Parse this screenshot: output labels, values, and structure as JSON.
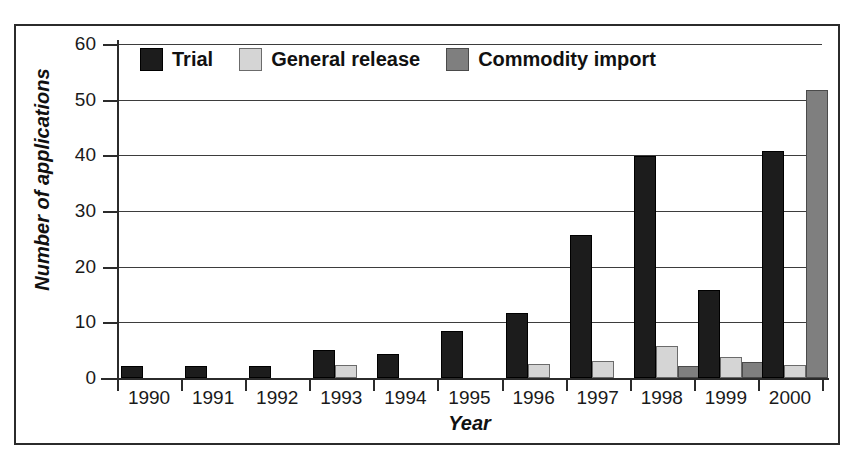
{
  "chart_data": {
    "type": "bar",
    "title": "",
    "xlabel": "Year",
    "ylabel": "Number of applications",
    "categories": [
      "1990",
      "1991",
      "1992",
      "1993",
      "1994",
      "1995",
      "1996",
      "1997",
      "1998",
      "1999",
      "2000"
    ],
    "series": [
      {
        "name": "Trial",
        "color": "#1c1c1c",
        "values": [
          2.1,
          2.1,
          2.1,
          5.0,
          4.3,
          8.5,
          11.6,
          25.7,
          39.8,
          15.9,
          40.8
        ]
      },
      {
        "name": "General release",
        "color": "#d5d5d5",
        "values": [
          0,
          0,
          0,
          2.3,
          0,
          0,
          2.5,
          3.1,
          5.7,
          3.8,
          2.3
        ]
      },
      {
        "name": "Commodity import",
        "color": "#7f7f7f",
        "values": [
          0,
          0,
          0,
          0,
          0,
          0,
          0,
          0,
          2.1,
          2.9,
          51.8
        ]
      }
    ],
    "ylim": [
      0,
      60
    ],
    "yticks": [
      0,
      10,
      20,
      30,
      40,
      50,
      60
    ],
    "ytick_labels": [
      "0",
      "10",
      "20",
      "30",
      "40",
      "50",
      "60"
    ],
    "grid": true,
    "legend_position": "top-left-inside"
  },
  "legend": {
    "items": [
      {
        "label": "Trial",
        "swatch": "trial"
      },
      {
        "label": "General release",
        "swatch": "general"
      },
      {
        "label": "Commodity import",
        "swatch": "commodity"
      }
    ]
  }
}
